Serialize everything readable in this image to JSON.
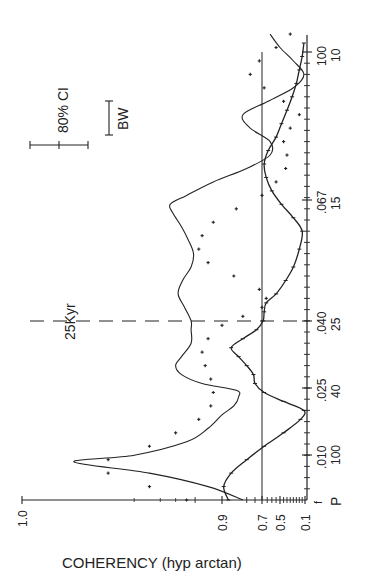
{
  "chart_data": {
    "type": "line",
    "orientation": "rotated 90deg counterclockwise (frequency axis vertical on right, coherency axis horizontal at bottom)",
    "title": "",
    "xlabel": "f / P (frequency cycles per kyr / period kyr)",
    "ylabel": "COHERENCY (hyp arctan)",
    "x_axis": {
      "name": "frequency",
      "row1_label": "f",
      "row2_label": "P",
      "ticks": [
        {
          "f": ".010",
          "P": "100",
          "value": 0.01
        },
        {
          "f": ".025",
          "P": "40",
          "value": 0.025
        },
        {
          "f": ".040",
          "P": "25",
          "value": 0.04
        },
        {
          "f": ".067",
          "P": "15",
          "value": 0.067
        },
        {
          "f": "100",
          "P": "10",
          "value": 0.1
        }
      ],
      "range": [
        0,
        0.1
      ]
    },
    "y_axis": {
      "name": "coherency",
      "scale": "hyperbolic arctangent",
      "tick_labels": [
        "1.0",
        "0.9",
        "0.7",
        "0.5",
        "0.1"
      ],
      "tick_values": [
        1.0,
        0.9,
        0.7,
        0.5,
        0.1
      ],
      "range": [
        0.1,
        1.0
      ]
    },
    "reference_lines": [
      {
        "type": "horizontal",
        "value": 0.7,
        "label": "coherency 0.7 significance level"
      },
      {
        "type": "vertical-dashed",
        "value": 0.04,
        "label": "25Kyr"
      }
    ],
    "annotations": [
      {
        "text": "80% CI",
        "kind": "error bar"
      },
      {
        "text": "BW",
        "kind": "bandwidth bar"
      },
      {
        "text": "25Kyr",
        "kind": "dashed line label"
      }
    ],
    "series": [
      {
        "name": "thin solid line",
        "style": "solid",
        "points": [
          [
            0.0,
            0.82
          ],
          [
            0.003,
            0.93
          ],
          [
            0.006,
            0.985
          ],
          [
            0.0085,
            0.998
          ],
          [
            0.01,
            0.99
          ],
          [
            0.013,
            0.96
          ],
          [
            0.016,
            0.93
          ],
          [
            0.019,
            0.9
          ],
          [
            0.021,
            0.86
          ],
          [
            0.023,
            0.84
          ],
          [
            0.0245,
            0.85
          ],
          [
            0.026,
            0.94
          ],
          [
            0.028,
            0.965
          ],
          [
            0.03,
            0.97
          ],
          [
            0.032,
            0.965
          ],
          [
            0.035,
            0.955
          ],
          [
            0.038,
            0.955
          ],
          [
            0.04,
            0.955
          ],
          [
            0.043,
            0.962
          ],
          [
            0.046,
            0.968
          ],
          [
            0.049,
            0.964
          ],
          [
            0.052,
            0.955
          ],
          [
            0.055,
            0.952
          ],
          [
            0.058,
            0.958
          ],
          [
            0.061,
            0.965
          ],
          [
            0.064,
            0.972
          ],
          [
            0.066,
            0.974
          ],
          [
            0.068,
            0.96
          ],
          [
            0.071,
            0.92
          ],
          [
            0.074,
            0.8
          ],
          [
            0.077,
            0.62
          ],
          [
            0.08,
            0.62
          ],
          [
            0.083,
            0.78
          ],
          [
            0.086,
            0.82
          ],
          [
            0.089,
            0.64
          ],
          [
            0.092,
            0.3
          ],
          [
            0.095,
            0.12
          ],
          [
            0.098,
            0.3
          ],
          [
            0.101,
            0.5
          ],
          [
            0.104,
            0.62
          ]
        ]
      },
      {
        "name": "dotted (crosses) line",
        "style": "dotted",
        "points": [
          [
            0.0,
            0.96
          ],
          [
            0.003,
            0.985
          ],
          [
            0.006,
            0.995
          ],
          [
            0.009,
            0.995
          ],
          [
            0.012,
            0.985
          ],
          [
            0.015,
            0.97
          ],
          [
            0.018,
            0.945
          ],
          [
            0.021,
            0.925
          ],
          [
            0.024,
            0.92
          ],
          [
            0.027,
            0.925
          ],
          [
            0.03,
            0.935
          ],
          [
            0.033,
            0.94
          ],
          [
            0.036,
            0.93
          ],
          [
            0.039,
            0.9
          ],
          [
            0.041,
            0.82
          ],
          [
            0.043,
            0.7
          ],
          [
            0.045,
            0.66
          ],
          [
            0.047,
            0.72
          ],
          [
            0.05,
            0.86
          ],
          [
            0.053,
            0.93
          ],
          [
            0.056,
            0.945
          ],
          [
            0.059,
            0.94
          ],
          [
            0.062,
            0.92
          ],
          [
            0.065,
            0.85
          ],
          [
            0.068,
            0.7
          ],
          [
            0.071,
            0.55
          ],
          [
            0.074,
            0.42
          ],
          [
            0.077,
            0.4
          ],
          [
            0.08,
            0.45
          ],
          [
            0.083,
            0.35
          ],
          [
            0.086,
            0.2
          ],
          [
            0.089,
            0.45
          ],
          [
            0.092,
            0.68
          ],
          [
            0.095,
            0.78
          ],
          [
            0.098,
            0.72
          ],
          [
            0.101,
            0.55
          ],
          [
            0.104,
            0.35
          ]
        ]
      },
      {
        "name": "solid line with tick marks",
        "style": "solid-ticked",
        "points": [
          [
            0.0,
            0.88
          ],
          [
            0.003,
            0.895
          ],
          [
            0.006,
            0.87
          ],
          [
            0.009,
            0.8
          ],
          [
            0.012,
            0.68
          ],
          [
            0.015,
            0.45
          ],
          [
            0.018,
            0.18
          ],
          [
            0.02,
            0.12
          ],
          [
            0.022,
            0.45
          ],
          [
            0.024,
            0.68
          ],
          [
            0.026,
            0.75
          ],
          [
            0.028,
            0.76
          ],
          [
            0.03,
            0.8
          ],
          [
            0.032,
            0.84
          ],
          [
            0.034,
            0.87
          ],
          [
            0.036,
            0.82
          ],
          [
            0.038,
            0.74
          ],
          [
            0.04,
            0.69
          ],
          [
            0.042,
            0.68
          ],
          [
            0.044,
            0.66
          ],
          [
            0.046,
            0.55
          ],
          [
            0.049,
            0.42
          ],
          [
            0.052,
            0.3
          ],
          [
            0.056,
            0.2
          ],
          [
            0.06,
            0.15
          ],
          [
            0.063,
            0.3
          ],
          [
            0.066,
            0.48
          ],
          [
            0.069,
            0.6
          ],
          [
            0.072,
            0.66
          ],
          [
            0.075,
            0.68
          ],
          [
            0.078,
            0.64
          ],
          [
            0.081,
            0.55
          ],
          [
            0.084,
            0.48
          ],
          [
            0.087,
            0.4
          ],
          [
            0.09,
            0.32
          ],
          [
            0.093,
            0.25
          ],
          [
            0.096,
            0.2
          ],
          [
            0.099,
            0.15
          ],
          [
            0.102,
            0.12
          ]
        ]
      }
    ]
  },
  "labels": {
    "y_axis_title": "COHERENCY (hyp arctan)",
    "ci_label": "80% CI",
    "bw_label": "BW",
    "line_label": "25Kyr",
    "f_label": "f",
    "p_label": "P"
  }
}
